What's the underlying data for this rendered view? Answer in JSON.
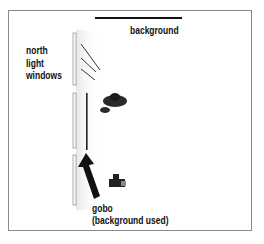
{
  "diagram": {
    "type": "lighting-setup-top-view",
    "labels": {
      "background": "background",
      "windows_line1": "north",
      "windows_line2": "light",
      "windows_line3": "windows",
      "gobo_line1": "gobo",
      "gobo_line2": "(background used)"
    },
    "elements": [
      {
        "name": "background",
        "shape": "line"
      },
      {
        "name": "north-light-windows",
        "shape": "three window panes"
      },
      {
        "name": "light-rays",
        "shape": "diagonal lines",
        "count": 3
      },
      {
        "name": "gobo",
        "shape": "vertical bar"
      },
      {
        "name": "subject",
        "shape": "top-view figure"
      },
      {
        "name": "camera",
        "shape": "camera icon"
      },
      {
        "name": "gobo-arrow",
        "shape": "arrow"
      }
    ],
    "colors": {
      "frame": "#8a8a8a",
      "ink": "#111111",
      "window": "#c8c8c8"
    }
  }
}
